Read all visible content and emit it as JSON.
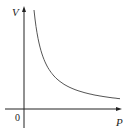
{
  "chart_data": {
    "type": "line",
    "title": "",
    "xlabel": "P",
    "ylabel": "V",
    "origin_label": "0",
    "relation": "V = k / P (inverse proportion, hyperbola)",
    "series": [
      {
        "name": "V vs P",
        "x": [
          10,
          15,
          20,
          26,
          35,
          45,
          60,
          75,
          96
        ],
        "y": [
          99,
          66,
          50,
          38,
          28,
          22,
          16.5,
          13.2,
          10.3
        ]
      }
    ],
    "grid": false,
    "legend": "none",
    "ticks": "none"
  },
  "labels": {
    "y_axis": "V",
    "x_axis": "P",
    "origin": "0"
  },
  "colors": {
    "axis": "#222222",
    "curve": "#555555"
  }
}
